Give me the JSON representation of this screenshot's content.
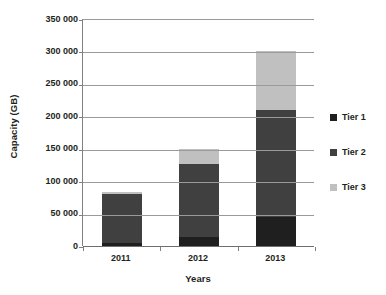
{
  "chart_data": {
    "type": "bar",
    "stacked": true,
    "title": "",
    "xlabel": "Years",
    "ylabel": "Capacity (GB)",
    "categories": [
      "2011",
      "2012",
      "2013"
    ],
    "series": [
      {
        "name": "Tier 1",
        "color": "#1f1f1f",
        "values": [
          4000,
          14000,
          45000
        ]
      },
      {
        "name": "Tier 2",
        "color": "#404040",
        "values": [
          76000,
          113000,
          165000
        ]
      },
      {
        "name": "Tier 3",
        "color": "#c0c0c0",
        "values": [
          4000,
          22000,
          90000
        ]
      }
    ],
    "totals": [
      84000,
      149000,
      300000
    ],
    "ylim": [
      0,
      350000
    ],
    "ytick_step": 50000,
    "ytick_labels": [
      "350 000",
      "300 000",
      "250 000",
      "200 000",
      "150 000",
      "100 000",
      "50 000",
      "0"
    ],
    "ytick_values": [
      350000,
      300000,
      250000,
      200000,
      150000,
      100000,
      50000,
      0
    ],
    "grid": true,
    "grid_axis": "y",
    "legend_position": "right",
    "legend_entries": [
      "Tier 1",
      "Tier 2",
      "Tier 3"
    ],
    "thousands_separator": " "
  }
}
